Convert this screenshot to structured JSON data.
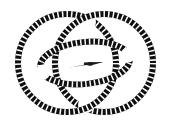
{
  "figure": {
    "background_color": "#ffffff",
    "stroke_color": "#101010",
    "tick_color": "#ffffff",
    "arrow_color": "#1a1a1a",
    "canvas": {
      "width": 171,
      "height": 134
    },
    "elements": [
      {
        "name": "left-circle",
        "shape": "circle",
        "cx": 67,
        "cy": 63,
        "r": 49,
        "band_width": 6,
        "dash": "2.6 2.2",
        "label": "Left ring"
      },
      {
        "name": "right-circle",
        "shape": "circle",
        "cx": 104,
        "cy": 63,
        "r": 49,
        "band_width": 6,
        "dash": "2.6 2.2",
        "label": "Right ring"
      },
      {
        "name": "center-ellipse",
        "shape": "ellipse",
        "cx": 85,
        "cy": 63,
        "rx": 45,
        "ry": 21,
        "rotation": -6,
        "band_width": 6,
        "dash": "2.6 2.2",
        "label": "Central ellipse"
      },
      {
        "name": "axis-arrow",
        "shape": "arrow",
        "x1": 70,
        "y1": 67,
        "x2": 103,
        "y2": 62,
        "label": "Axis arrow pointing right"
      }
    ]
  },
  "chart_data": {
    "type": "diagram",
    "xlabel": "",
    "ylabel": "",
    "series": [
      {
        "name": "Left ring",
        "geometry": "circle",
        "center": [
          67,
          63
        ],
        "radius": 49
      },
      {
        "name": "Right ring",
        "geometry": "circle",
        "center": [
          104,
          63
        ],
        "radius": 49
      },
      {
        "name": "Central ellipse",
        "geometry": "ellipse",
        "center": [
          85,
          63
        ],
        "radii": [
          45,
          21
        ],
        "rotation_deg": -6
      },
      {
        "name": "Axis arrow",
        "geometry": "arrow",
        "from": [
          70,
          67
        ],
        "to": [
          103,
          62
        ]
      }
    ],
    "legend": []
  }
}
